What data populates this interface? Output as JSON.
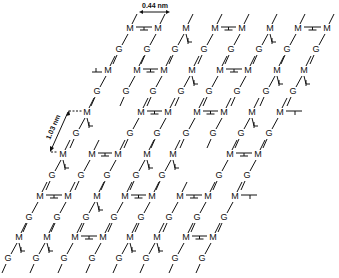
{
  "figure": {
    "annotations": {
      "horizontal_spacing": "0.44 nm",
      "vertical_repeat": "1.03 nm"
    },
    "residue_labels": {
      "mannuronate": "M",
      "guluronate": "G"
    },
    "colors": {
      "ink": "#111111",
      "background": "#ffffff"
    },
    "rows": [
      {
        "y": 29,
        "m_x": [
          130,
          158,
          186,
          215,
          242,
          270,
          298,
          327
        ],
        "bridges": [
          [
            0,
            1
          ],
          [
            3,
            4
          ],
          [
            6,
            7
          ]
        ],
        "side_down": [
          2,
          5
        ],
        "side_left": [],
        "side_right": []
      },
      {
        "y": 71,
        "m_x": [
          108,
          137,
          164,
          192,
          220,
          248,
          277,
          304
        ],
        "bridges": [
          [
            1,
            2
          ],
          [
            4,
            5
          ]
        ],
        "side_down": [
          3,
          6,
          7
        ],
        "side_left": [
          0
        ],
        "side_right": []
      },
      {
        "y": 113,
        "m_x": [
          87,
          141,
          168,
          197,
          224,
          252,
          280
        ],
        "bridges": [
          [
            1,
            2
          ],
          [
            3,
            4
          ]
        ],
        "side_down": [
          0,
          5
        ],
        "side_left": [],
        "side_right": [
          6
        ]
      },
      {
        "y": 155,
        "m_x": [
          63,
          92,
          118,
          147,
          173,
          230,
          258
        ],
        "bridges": [
          [
            1,
            2
          ],
          [
            5,
            6
          ]
        ],
        "side_down": [
          0,
          3,
          4
        ],
        "side_left": [],
        "side_right": []
      },
      {
        "y": 197,
        "m_x": [
          40,
          68,
          97,
          125,
          152,
          180,
          208,
          235
        ],
        "bridges": [
          [
            0,
            1
          ],
          [
            3,
            4
          ],
          [
            5,
            6
          ]
        ],
        "side_down": [
          2
        ],
        "side_left": [],
        "side_right": [
          7
        ]
      },
      {
        "y": 238,
        "m_x": [
          19,
          47,
          75,
          103,
          130,
          157,
          186,
          213
        ],
        "bridges": [
          [
            2,
            3
          ],
          [
            6,
            7
          ]
        ],
        "side_down": [
          0,
          1,
          4,
          5
        ],
        "side_left": [],
        "side_right": []
      }
    ]
  }
}
